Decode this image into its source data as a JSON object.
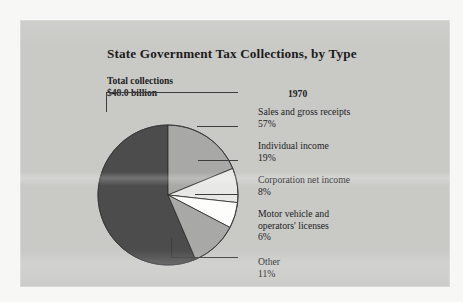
{
  "figure": {
    "title": "State Government Tax Collections, by Type",
    "total_label_line1": "Total collections",
    "total_label_line2": "$48.0 billion",
    "year": "1970",
    "panel_color": "#c9c9c6"
  },
  "labels": {
    "sales": {
      "name": "Sales and gross receipts",
      "pct": "57%"
    },
    "individual": {
      "name": "Individual income",
      "pct": "19%"
    },
    "corporation": {
      "name": "Corporation net income",
      "pct": "8%"
    },
    "motor": {
      "name_line1": "Motor vehicle and",
      "name_line2": "operators' licenses",
      "pct": "6%"
    },
    "other": {
      "name": "Other",
      "pct": "11%"
    }
  },
  "chart_data": {
    "type": "pie",
    "title": "State Government Tax Collections, by Type",
    "subtitle": "Total collections $48.0 billion",
    "annotations": [
      "1970",
      "Total collections",
      "$48.0 billion"
    ],
    "total_value": 48.0,
    "total_units": "billion USD",
    "year": 1970,
    "unit": "percent",
    "start_angle_deg": 0,
    "direction": "clockwise",
    "legend": "leader-line callouts at right",
    "grid": false,
    "categories": [
      "Sales and gross receipts",
      "Individual income",
      "Corporation net income",
      "Motor vehicle and operators' licenses",
      "Other"
    ],
    "values": [
      57,
      19,
      8,
      6,
      11
    ],
    "slice_order_clockwise_from_top": [
      "Individual income",
      "Corporation net income",
      "Motor vehicle and operators' licenses",
      "Other",
      "Sales and gross receipts"
    ],
    "colors": {
      "Sales and gross receipts": "#4c4c4c",
      "Individual income": "#a8a8a6",
      "Corporation net income": "#e8e8e6",
      "Motor vehicle and operators' licenses": "#fdfdfb",
      "Other": "#a8a8a6"
    }
  }
}
